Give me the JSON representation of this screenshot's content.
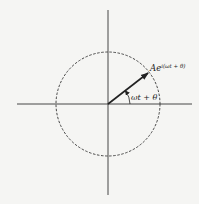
{
  "diagram": {
    "type": "phasor",
    "colors": {
      "background": "#f5f5f3",
      "ink": "#222222"
    },
    "axes": {
      "horizontal": {
        "x1": 17,
        "x2": 192,
        "y": 104
      },
      "vertical": {
        "x": 108,
        "y1": 10,
        "y2": 195
      }
    },
    "circle": {
      "cx": 108,
      "cy": 104,
      "r": 52,
      "style": "dashed"
    },
    "phasor": {
      "x1": 108,
      "y1": 104,
      "x2": 149,
      "y2": 72
    },
    "labels": {
      "phasor_base": "Ae",
      "phasor_exponent": "i(ωt + θ)",
      "angle": "ωt + θ"
    }
  }
}
